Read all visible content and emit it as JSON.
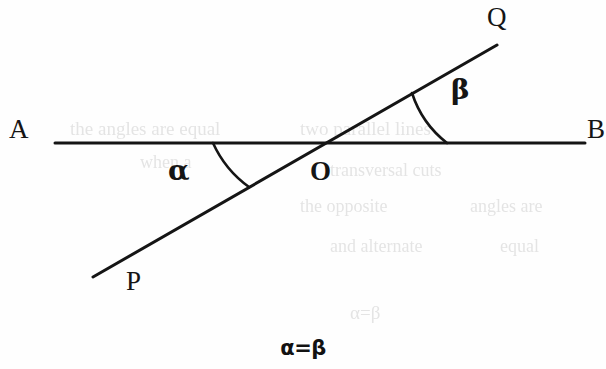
{
  "figure": {
    "type": "geometry-diagram",
    "caption": "α=β",
    "background_color": "#fefefe",
    "stroke_color": "#151515",
    "stroke_width": 3
  },
  "labels": {
    "A": "A",
    "B": "B",
    "P": "P",
    "Q": "Q",
    "O": "O",
    "alpha": "α",
    "beta": "β"
  },
  "geometry": {
    "line_AB": {
      "name": "AB",
      "x1": 55,
      "y1": 143,
      "x2": 585,
      "y2": 143
    },
    "line_PQ": {
      "name": "PQ",
      "x1": 93,
      "y1": 277,
      "x2": 497,
      "y2": 45
    },
    "intersection": {
      "name": "O",
      "x": 322,
      "y": 143
    },
    "arc_alpha": {
      "start_x": 213,
      "start_y": 143,
      "end_x": 249,
      "end_y": 187,
      "radius": 110
    },
    "arc_beta": {
      "start_x": 412,
      "start_y": 93,
      "end_x": 447,
      "end_y": 143,
      "radius": 104
    }
  },
  "ghost_text": {
    "note": "faint show-through of text printed on the reverse of the scanned page",
    "lines": [
      {
        "text": "the angles are equal",
        "x": 70,
        "y": 118,
        "size": 19
      },
      {
        "text": "two parallel lines",
        "x": 300,
        "y": 118,
        "size": 19
      },
      {
        "text": "when a",
        "x": 140,
        "y": 152,
        "size": 18
      },
      {
        "text": "transversal cuts",
        "x": 330,
        "y": 160,
        "size": 18
      },
      {
        "text": "the opposite",
        "x": 300,
        "y": 196,
        "size": 18
      },
      {
        "text": "angles are",
        "x": 470,
        "y": 196,
        "size": 18
      },
      {
        "text": "and alternate",
        "x": 330,
        "y": 236,
        "size": 18
      },
      {
        "text": "equal",
        "x": 500,
        "y": 236,
        "size": 18
      },
      {
        "text": "α=β",
        "x": 350,
        "y": 302,
        "size": 19
      }
    ]
  }
}
